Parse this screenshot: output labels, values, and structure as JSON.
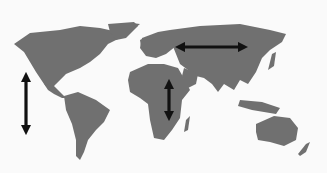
{
  "map": {
    "type": "world-map",
    "land_color": "#707070",
    "background_color": "#fafafa",
    "arrow_color": "#111111",
    "arrows": [
      {
        "id": "pacific-coast-americas",
        "orientation": "vertical",
        "direction": "double",
        "x1": 26,
        "y1": 73,
        "x2": 26,
        "y2": 134
      },
      {
        "id": "eurasia-east-west",
        "orientation": "horizontal",
        "direction": "double",
        "x1": 176,
        "y1": 47,
        "x2": 247,
        "y2": 47
      },
      {
        "id": "africa-north-south",
        "orientation": "vertical",
        "direction": "double",
        "x1": 169,
        "y1": 80,
        "x2": 169,
        "y2": 120
      }
    ]
  }
}
